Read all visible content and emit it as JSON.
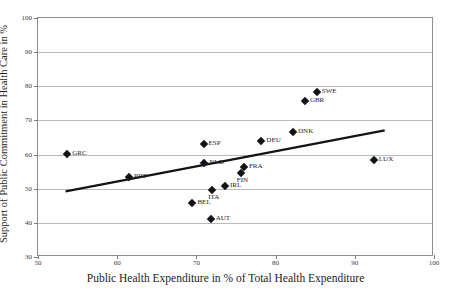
{
  "title_strip": "",
  "chart_data": {
    "type": "scatter",
    "title": "",
    "xlabel": "Public Health Expenditure in % of Total Health Expenditure",
    "ylabel": "Support of Public Commitment in Health Care in %",
    "xlim": [
      50,
      100
    ],
    "ylim": [
      30,
      100
    ],
    "xticks": [
      50,
      60,
      70,
      80,
      90,
      100
    ],
    "yticks": [
      30,
      40,
      50,
      60,
      70,
      80,
      90,
      100
    ],
    "grid": "horizontal",
    "legend": "none",
    "marker": "filled-diamond",
    "marker_color": "#141418",
    "points": [
      {
        "label": "GRC",
        "x": 53.7,
        "y": 60.3,
        "label_pos": "right"
      },
      {
        "label": "PRT",
        "x": 61.5,
        "y": 53.3,
        "label_pos": "right"
      },
      {
        "label": "BEL",
        "x": 69.5,
        "y": 45.8,
        "label_pos": "right"
      },
      {
        "label": "ESP",
        "x": 70.9,
        "y": 63.1,
        "label_pos": "right"
      },
      {
        "label": "NLD",
        "x": 71.0,
        "y": 57.6,
        "label_pos": "right"
      },
      {
        "label": "AUT",
        "x": 71.8,
        "y": 41.2,
        "label_pos": "right"
      },
      {
        "label": "ITA",
        "x": 72.0,
        "y": 49.6,
        "label_pos": "below"
      },
      {
        "label": "IRL",
        "x": 73.6,
        "y": 50.8,
        "label_pos": "right"
      },
      {
        "label": "FIN",
        "x": 75.6,
        "y": 54.5,
        "label_pos": "below"
      },
      {
        "label": "FRA",
        "x": 76.0,
        "y": 56.4,
        "label_pos": "right"
      },
      {
        "label": "DEU",
        "x": 78.2,
        "y": 64.0,
        "label_pos": "right"
      },
      {
        "label": "DNK",
        "x": 82.2,
        "y": 66.5,
        "label_pos": "right"
      },
      {
        "label": "GBR",
        "x": 83.7,
        "y": 75.6,
        "label_pos": "right"
      },
      {
        "label": "SWE",
        "x": 85.2,
        "y": 78.3,
        "label_pos": "right"
      },
      {
        "label": "LUX",
        "x": 92.4,
        "y": 58.3,
        "label_pos": "right"
      }
    ],
    "trendline": {
      "x0": 53.5,
      "y0": 48.8,
      "x1": 94.0,
      "y1": 66.8,
      "color": "#141418"
    }
  }
}
